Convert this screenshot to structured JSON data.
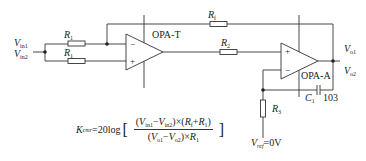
{
  "inputs": {
    "vin1": {
      "base": "V",
      "sub": "in1"
    },
    "vin2": {
      "base": "V",
      "sub": "in2"
    }
  },
  "resistors": {
    "r1_top": {
      "base": "R",
      "sub": "1"
    },
    "r1_bottom": {
      "base": "R",
      "sub": "1"
    },
    "rf": {
      "base": "R",
      "sub": "f"
    },
    "r2": {
      "base": "R",
      "sub": "2"
    },
    "r3": {
      "base": "R",
      "sub": "3"
    }
  },
  "opamps": {
    "test": {
      "label": "OPA-T",
      "minus": "−",
      "plus": "+"
    },
    "aux": {
      "label": "OPA-A",
      "minus": "−",
      "plus": "+"
    }
  },
  "capacitor": {
    "base": "C",
    "sub": "1",
    "value": "103"
  },
  "outputs": {
    "vo1": {
      "base": "V",
      "sub": "o1"
    },
    "vo2": {
      "base": "V",
      "sub": "o2"
    }
  },
  "reference": {
    "base": "V",
    "sub": "ref",
    "value": "=0V"
  },
  "formula": {
    "lhs_base": "K",
    "lhs_sub": "cmr",
    "prefix": "=20log",
    "open_bracket": "[",
    "close_bracket": "]",
    "numerator": "(V_in1−V_in2)×(R_f+R_1)",
    "num_parts": {
      "p1": "(",
      "v1": "V",
      "v1s": "in1",
      "minus": "−",
      "v2": "V",
      "v2s": "in2",
      "p2": ")×(",
      "r1": "R",
      "r1s": "f",
      "plus": "+",
      "r2": "R",
      "r2s": "1",
      "p3": ")"
    },
    "denominator": "(V_o1−V_o2)×R_1",
    "den_parts": {
      "p1": "(",
      "v1": "V",
      "v1s": "o1",
      "minus": "−",
      "v2": "V",
      "v2s": "o2",
      "p2": ")×",
      "r": "R",
      "rs": "1"
    }
  },
  "colors": {
    "wire": "#333333",
    "background": "#ffffff"
  }
}
